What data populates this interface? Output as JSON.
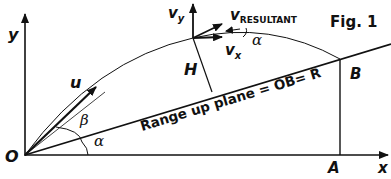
{
  "figure": {
    "title": "Fig. 1",
    "labels": {
      "y_axis": "y",
      "x_axis": "x",
      "origin": "O",
      "point_a": "A",
      "point_b": "B",
      "height": "H",
      "initial_velocity": "u",
      "angle_beta": "β",
      "angle_alpha_base": "α",
      "angle_alpha_top": "α",
      "vy_main": "v",
      "vy_sub": "y",
      "vx_main": "v",
      "vx_sub": "x",
      "vres_main": "v",
      "vres_sub": "RESULTANT",
      "range_text": "Range up plane = OB= R"
    },
    "colors": {
      "stroke": "#111111",
      "background": "#ffffff"
    }
  }
}
